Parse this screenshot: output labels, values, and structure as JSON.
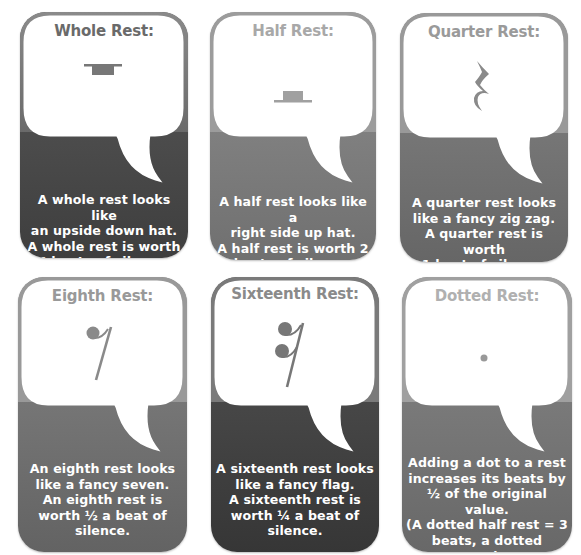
{
  "cards": [
    {
      "id": "whole",
      "title": "Whole Rest:",
      "title_color": "#6a6a6a",
      "symbol": "whole-rest-icon",
      "panel_color_top": "#5a5a5a",
      "panel_color_bottom": "#3e3e3e",
      "description_lines": [
        "A whole rest looks like",
        "an upside down hat.",
        "A whole rest is worth",
        "4 beats of silence."
      ]
    },
    {
      "id": "half",
      "title": "Half Rest:",
      "title_color": "#a8a8a8",
      "symbol": "half-rest-icon",
      "panel_color_top": "#8e8e8e",
      "panel_color_bottom": "#707070",
      "description_lines": [
        "A half rest looks like a",
        "right side up hat.",
        "A half rest is worth 2",
        "beats of silence."
      ]
    },
    {
      "id": "quarter",
      "title": "Quarter Rest:",
      "title_color": "#9a9a9a",
      "symbol": "quarter-rest-icon",
      "panel_color_top": "#858585",
      "panel_color_bottom": "#666666",
      "description_lines": [
        "A quarter rest looks",
        "like a fancy zig zag.",
        "A quarter rest is worth",
        "1 beat of silence."
      ]
    },
    {
      "id": "eighth",
      "title": "Eighth Rest:",
      "title_color": "#999999",
      "symbol": "eighth-rest-icon",
      "panel_color_top": "#858585",
      "panel_color_bottom": "#636363",
      "description_lines": [
        "An eighth rest looks",
        "like a fancy seven.",
        "An eighth rest is",
        "worth ½ a beat of",
        "silence."
      ]
    },
    {
      "id": "sixteenth",
      "title": "Sixteenth Rest:",
      "title_color": "#8a8a8a",
      "symbol": "sixteenth-rest-icon",
      "panel_color_top": "#555555",
      "panel_color_bottom": "#363636",
      "description_lines": [
        "A sixteenth rest looks",
        "like a fancy flag.",
        "A sixteenth rest is",
        "worth ¼ a beat of",
        "silence."
      ]
    },
    {
      "id": "dotted",
      "title": "Dotted Rest:",
      "title_color": "#b0b0b0",
      "symbol": "dot-icon",
      "panel_color_top": "#888888",
      "panel_color_bottom": "#686868",
      "description_lines": [
        "Adding a dot to a rest",
        "increases its beats by",
        "½ of the original value.",
        "(A dotted half rest = 3",
        "beats, a dotted quarter",
        "rest = 1 ½ beats)"
      ]
    }
  ]
}
